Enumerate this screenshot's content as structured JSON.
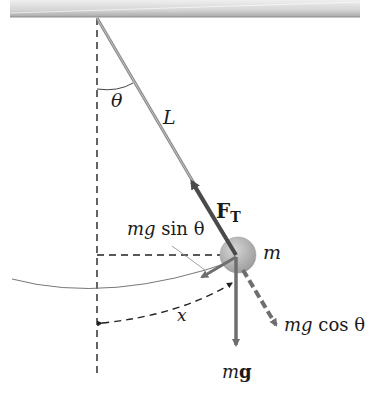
{
  "diagram": {
    "type": "simple pendulum free-body diagram",
    "labels": {
      "theta": "θ",
      "length": "L",
      "tension_main": "F",
      "tension_sub": "T",
      "mass": "m",
      "tangential_force_mg": "mg",
      "tangential_force_rest": "sin θ",
      "normal_component_mg": "mg",
      "normal_component_rest": "cos θ",
      "weight_m": "m",
      "weight_g": "g",
      "displacement": "x"
    },
    "colors": {
      "ceiling_light": "#e8e8e8",
      "ceiling_dark": "#a0a0a0",
      "string": "#8a8a8a",
      "bob": "#b5b5b5",
      "vector": "#6e6e6e",
      "tension_vector": "#4a4a4a",
      "dashed": "#222222",
      "text": "#1a1a1a"
    }
  }
}
